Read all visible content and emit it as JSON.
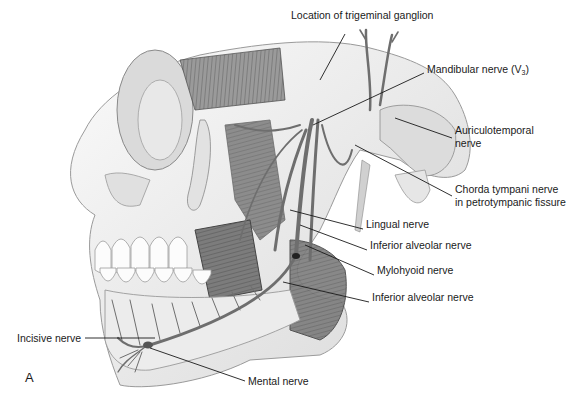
{
  "figure": {
    "panel_letter": "A"
  },
  "labels": [
    {
      "id": "trigeminal",
      "text": "Location of trigeminal ganglion",
      "x": 291,
      "y": 15
    },
    {
      "id": "mandibular",
      "text": "Mandibular nerve (V",
      "sub": "3",
      "suffix": ")",
      "x": 427,
      "y": 69
    },
    {
      "id": "auriculotemporal_1",
      "text": "Auriculotemporal",
      "x": 455,
      "y": 130
    },
    {
      "id": "auriculotemporal_2",
      "text": "nerve",
      "x": 455,
      "y": 143
    },
    {
      "id": "chorda_1",
      "text": "Chorda tympani nerve",
      "x": 455,
      "y": 189
    },
    {
      "id": "chorda_2",
      "text": "in petrotympanic fissure",
      "x": 455,
      "y": 202
    },
    {
      "id": "lingual",
      "text": "Lingual nerve",
      "x": 366,
      "y": 224
    },
    {
      "id": "inferior_alveolar_1",
      "text": "Inferior alveolar nerve",
      "x": 370,
      "y": 245
    },
    {
      "id": "mylohyoid",
      "text": "Mylohyoid nerve",
      "x": 377,
      "y": 270
    },
    {
      "id": "inferior_alveolar_2",
      "text": "Inferior alveolar nerve",
      "x": 372,
      "y": 297
    },
    {
      "id": "incisive",
      "text": "Incisive nerve",
      "x": 17,
      "y": 333
    },
    {
      "id": "mental",
      "text": "Mental nerve",
      "x": 248,
      "y": 376
    }
  ],
  "colors": {
    "bone": "#f2f2f2",
    "bone_shade": "#c8c8c8",
    "muscle": "#7a7a7a",
    "muscle_dark": "#5a5a5a",
    "nerve": "#707070",
    "leader": "#1a1a1a",
    "text": "#1a1a1a"
  }
}
